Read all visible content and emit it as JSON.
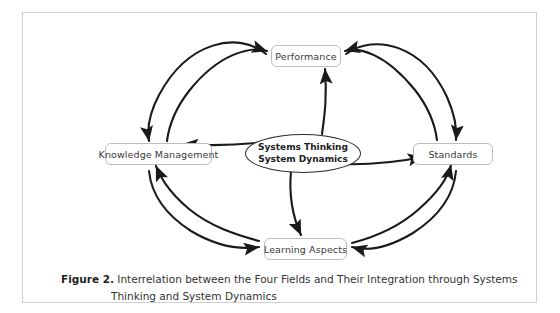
{
  "figure": {
    "caption_label": "Figure 2.",
    "caption_text": "Interrelation between the Four Fields and Their Integration through Systems",
    "caption_text_line2": "Thinking and System Dynamics"
  },
  "diagram": {
    "type": "relationship-cycle",
    "center": {
      "label_line1": "Systems Thinking",
      "label_line2": "System Dynamics",
      "shape": "ellipse"
    },
    "nodes": [
      {
        "id": "performance",
        "label": "Performance",
        "position": "top"
      },
      {
        "id": "knowledge-management",
        "label": "Knowledge Management",
        "position": "left"
      },
      {
        "id": "standards",
        "label": "Standards",
        "position": "right"
      },
      {
        "id": "learning-aspects",
        "label": "Learning Aspects",
        "position": "bottom"
      }
    ],
    "edges": [
      {
        "from": "knowledge-management",
        "to": "performance",
        "style": "bidirectional-arc"
      },
      {
        "from": "performance",
        "to": "standards",
        "style": "bidirectional-arc"
      },
      {
        "from": "standards",
        "to": "learning-aspects",
        "style": "bidirectional-arc"
      },
      {
        "from": "learning-aspects",
        "to": "knowledge-management",
        "style": "bidirectional-arc"
      },
      {
        "from": "center",
        "to": "performance",
        "style": "arrow"
      },
      {
        "from": "center",
        "to": "knowledge-management",
        "style": "arrow"
      },
      {
        "from": "center",
        "to": "standards",
        "style": "arrow"
      },
      {
        "from": "center",
        "to": "learning-aspects",
        "style": "arrow"
      }
    ],
    "colors": {
      "arrow": "#1a1a1a",
      "node_border": "#bdbdbd",
      "ellipse_border": "#2b2b2b",
      "frame_border": "#cfcfcf",
      "text": "#3a3a3a"
    }
  }
}
